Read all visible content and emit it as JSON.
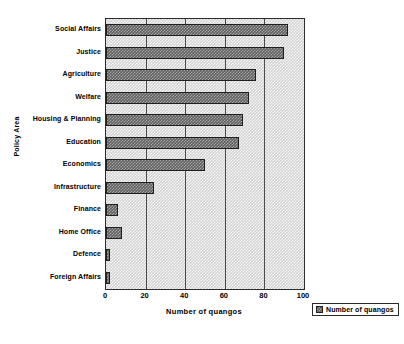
{
  "chart_data": {
    "type": "bar",
    "orientation": "horizontal",
    "title": "",
    "xlabel": "Number of quangos",
    "ylabel": "Policy Area",
    "xlim": [
      0,
      100
    ],
    "xticks": [
      0,
      20,
      40,
      60,
      80,
      100
    ],
    "grid": true,
    "legend_position": "bottom-right",
    "categories": [
      "Social Affairs",
      "Justice",
      "Agriculture",
      "Welfare",
      "Housing & Planning",
      "Education",
      "Economics",
      "Infrastructure",
      "Finance",
      "Home Office",
      "Defence",
      "Foreign Affairs"
    ],
    "series": [
      {
        "name": "Number of quangos",
        "values": [
          92,
          90,
          76,
          72,
          69,
          67,
          50,
          24,
          6,
          8,
          2,
          2
        ],
        "color": "#5d5d5d"
      }
    ]
  },
  "legend": {
    "entries": [
      {
        "label": "Number of quangos",
        "swatch": "bar-swatch-icon"
      }
    ]
  },
  "axes": {
    "x_tick_labels": [
      "0",
      "20",
      "40",
      "60",
      "80",
      "100"
    ],
    "x_title": "Number of quangos",
    "y_title": "Policy Area"
  }
}
